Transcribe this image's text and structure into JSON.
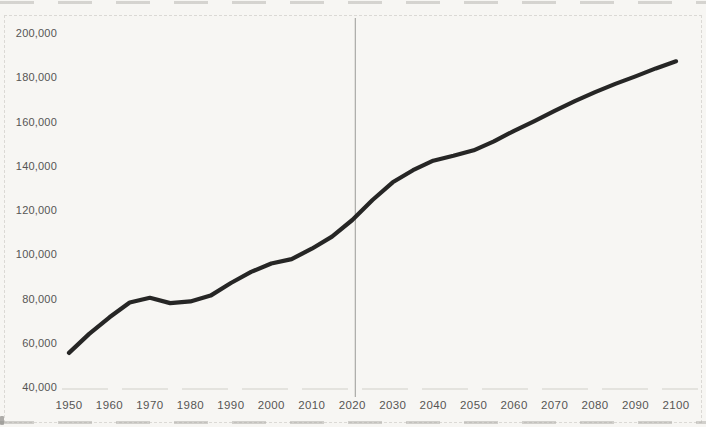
{
  "chart_data": {
    "type": "line",
    "title": "",
    "xlabel": "",
    "ylabel": "",
    "x": [
      1950,
      1955,
      1960,
      1965,
      1970,
      1975,
      1980,
      1985,
      1990,
      1995,
      2000,
      2005,
      2010,
      2015,
      2020,
      2025,
      2030,
      2035,
      2040,
      2045,
      2050,
      2055,
      2060,
      2065,
      2070,
      2075,
      2080,
      2085,
      2090,
      2095,
      2100
    ],
    "series": [
      {
        "name": "value",
        "values": [
          55400,
          64000,
          71500,
          78200,
          80300,
          77900,
          78700,
          81300,
          87000,
          92000,
          95800,
          97800,
          102500,
          108000,
          115500,
          124500,
          132500,
          138000,
          142300,
          144500,
          147000,
          151000,
          155800,
          160200,
          164800,
          169200,
          173300,
          177000,
          180400,
          184000,
          187200
        ]
      }
    ],
    "xlim": [
      1950,
      2100
    ],
    "ylim": [
      40000,
      200000
    ],
    "x_ticks": [
      1950,
      1960,
      1970,
      1980,
      1990,
      2000,
      2010,
      2020,
      2030,
      2040,
      2050,
      2060,
      2070,
      2080,
      2090,
      2100
    ],
    "y_ticks": [
      40000,
      60000,
      80000,
      100000,
      120000,
      140000,
      160000,
      180000,
      200000
    ],
    "y_tick_labels": [
      "40,000",
      "60,000",
      "80,000",
      "100,000",
      "120,000",
      "140,000",
      "160,000",
      "180,000",
      "200,000"
    ],
    "grid": false,
    "legend": "none",
    "annotations": [
      {
        "type": "vline",
        "x": 2020
      }
    ],
    "colors": {
      "line": "#1d1d1c",
      "vline": "#9a9a98",
      "baseline": "#cbc9c4",
      "tick_label": "#565553",
      "background": "#f7f6f3"
    }
  }
}
